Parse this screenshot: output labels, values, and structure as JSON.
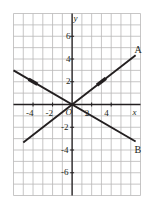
{
  "figure": {
    "title": "",
    "origin_label": "O",
    "x_axis_name": "x",
    "y_axis_name": "y"
  },
  "chart_data": {
    "type": "line",
    "title": "",
    "xlabel": "x",
    "ylabel": "y",
    "xlim": [
      -6,
      7
    ],
    "ylim": [
      -8,
      8
    ],
    "grid": true,
    "gridstep": 1,
    "legend": "none",
    "axis_through_origin": true,
    "x_ticks": [
      -4,
      -2,
      2,
      4
    ],
    "x_tick_labels": [
      "-4",
      "-2",
      "2",
      "4"
    ],
    "y_ticks": [
      6,
      4,
      2,
      -2,
      -4,
      -6
    ],
    "y_tick_labels": [
      "6",
      "4",
      "2",
      "-2",
      "-4",
      "-6"
    ],
    "series": [
      {
        "name": "A",
        "label": "A",
        "color": "#231f20",
        "slope": 0.6667,
        "intercept": 0,
        "x": [
          -5,
          6.5
        ],
        "y": [
          -3.33,
          4.33
        ],
        "marker_point": [
          3,
          2
        ],
        "label_position": [
          6.7,
          4.8
        ]
      },
      {
        "name": "B",
        "label": "B",
        "color": "#231f20",
        "slope": -0.5,
        "intercept": 0,
        "x": [
          -6,
          6.5
        ],
        "y": [
          3,
          -3.25
        ],
        "marker_point": [
          -4,
          2
        ],
        "label_position": [
          6.7,
          -4.0
        ]
      }
    ]
  }
}
